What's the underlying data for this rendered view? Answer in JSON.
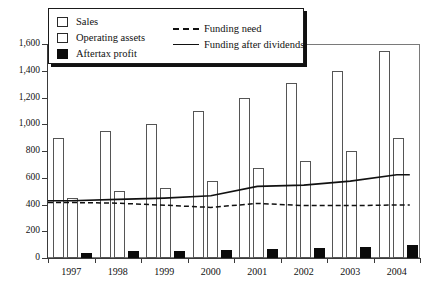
{
  "chart_data": {
    "type": "bar",
    "title": "",
    "xlabel": "",
    "ylabel": "",
    "categories": [
      "1997",
      "1998",
      "1999",
      "2000",
      "2001",
      "2002",
      "2003",
      "2004"
    ],
    "ylim": [
      0,
      1600
    ],
    "ytick_values": [
      0,
      200,
      400,
      600,
      800,
      1000,
      1200,
      1400,
      1600
    ],
    "ytick_labels": [
      "0",
      "200",
      "400",
      "600",
      "800",
      "1,000",
      "1,200",
      "1,400",
      "1,600"
    ],
    "grid": false,
    "legend_position": "top-left",
    "series": [
      {
        "name": "Sales",
        "kind": "bar",
        "style": "open",
        "values": [
          900,
          950,
          1000,
          1100,
          1200,
          1305,
          1400,
          1550
        ]
      },
      {
        "name": "Operating assets",
        "kind": "bar",
        "style": "open",
        "values": [
          450,
          500,
          525,
          575,
          675,
          725,
          800,
          900
        ]
      },
      {
        "name": "Aftertax profit",
        "kind": "bar",
        "style": "solid",
        "values": [
          40,
          50,
          52,
          62,
          68,
          75,
          85,
          95
        ]
      },
      {
        "name": "Funding need",
        "kind": "line",
        "style": "dashed",
        "values": [
          415,
          410,
          395,
          378,
          408,
          392,
          392,
          396
        ]
      },
      {
        "name": "Funding after dividends",
        "kind": "line",
        "style": "solid",
        "values": [
          428,
          438,
          448,
          465,
          535,
          545,
          575,
          622
        ]
      }
    ]
  },
  "legend": {
    "items": [
      {
        "label": "Sales",
        "marker": "open-square"
      },
      {
        "label": "Operating assets",
        "marker": "open-square"
      },
      {
        "label": "Aftertax profit",
        "marker": "filled-square"
      },
      {
        "label": "Funding need",
        "marker": "dashed-line"
      },
      {
        "label": "Funding after dividends",
        "marker": "solid-line"
      }
    ]
  },
  "colors": {
    "bar_fill_open": "#ffffff",
    "bar_fill_solid": "#0b0b0b",
    "bar_stroke": "#555555",
    "axis": "#3a3a3a",
    "line": "#111111"
  }
}
